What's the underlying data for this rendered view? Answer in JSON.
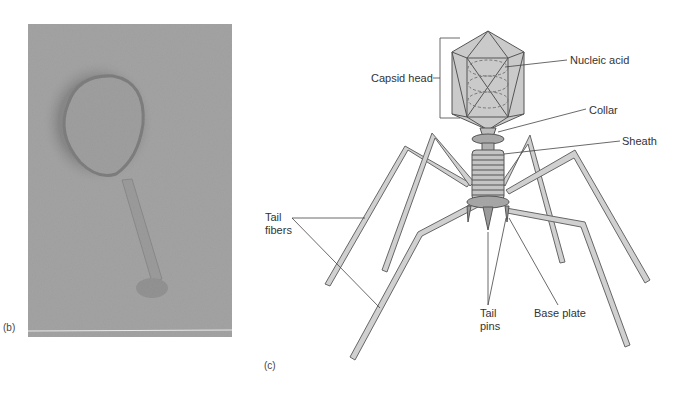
{
  "panels": {
    "b": {
      "label": "(b)",
      "description": "Electron micrograph of bacteriophage"
    },
    "c": {
      "label": "(c)",
      "description": "Diagram of T-even bacteriophage structure"
    }
  },
  "labels": {
    "capsid_head": "Capsid head",
    "nucleic_acid": "Nucleic acid",
    "collar": "Collar",
    "sheath": "Sheath",
    "tail_fibers_1": "Tail",
    "tail_fibers_2": "fibers",
    "tail_pins_1": "Tail",
    "tail_pins_2": "pins",
    "base_plate": "Base plate"
  },
  "colors": {
    "structure_fill": "#c8c8c8",
    "structure_stroke": "#555555",
    "micrograph_bg": "#a9a9a9",
    "leader_line": "#444444"
  }
}
